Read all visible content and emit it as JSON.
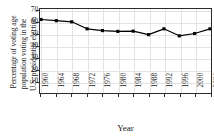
{
  "chart_data": {
    "type": "line",
    "title": "",
    "subtitle": "",
    "xlabel": "Year",
    "ylabel": "Percentage of voting age population voting in the U.S. presidential election",
    "ylabel_lines": [
      "Percentage of voting age",
      "population voting in the",
      "U.S. presidential election"
    ],
    "categories": [
      "1960",
      "1964",
      "1968",
      "1972",
      "1976",
      "1980",
      "1984",
      "1988",
      "1992",
      "1996",
      "2000",
      "2004"
    ],
    "x": [
      1960,
      1964,
      1968,
      1972,
      1976,
      1980,
      1984,
      1988,
      1992,
      1996,
      2000,
      2004
    ],
    "values": [
      63,
      62,
      61,
      55,
      53.5,
      52.8,
      53,
      50,
      55,
      49,
      51,
      55
    ],
    "series": [
      {
        "name": "Voter turnout",
        "values": [
          63,
          62,
          61,
          55,
          53.5,
          52.8,
          53,
          50,
          55,
          49,
          51,
          55
        ],
        "color": "#000000",
        "marker": "square",
        "line_width": 1.2
      }
    ],
    "xlim": [
      1960,
      2004
    ],
    "ylim": [
      0,
      72
    ],
    "yticks": [
      10,
      20,
      30,
      40,
      50,
      60,
      70
    ],
    "ytick_labels": [
      "10",
      "20",
      "30",
      "40",
      "50",
      "60",
      "70"
    ],
    "xticks": [
      1960,
      1964,
      1968,
      1972,
      1976,
      1980,
      1984,
      1988,
      1992,
      1996,
      2000,
      2004
    ],
    "xtick_labels": [
      "1960",
      "1964",
      "1968",
      "1972",
      "1976",
      "1980",
      "1984",
      "1988",
      "1992",
      "1996",
      "2000",
      "2004"
    ],
    "xtick_rotation": -90,
    "grid": true,
    "grid_color": "#e3e3e3",
    "legend": false,
    "legend_position": "none",
    "frame": true,
    "frame_color": "#2b2b2b",
    "background": "#ffffff"
  }
}
